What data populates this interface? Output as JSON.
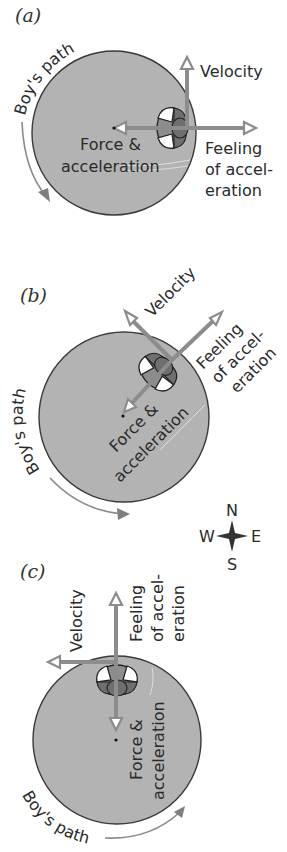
{
  "diagram": {
    "type": "physics-circular-motion",
    "panels": [
      {
        "id": "a",
        "label": "(a)",
        "path_label": "Boy's path",
        "velocity_label": "Velocity",
        "force_label_line1": "Force &",
        "force_label_line2": "acceleration",
        "feeling_label_line1": "Feeling",
        "feeling_label_line2": "of accel-",
        "feeling_label_line3": "eration",
        "boy_position": "east",
        "velocity_direction": "north",
        "force_direction": "west",
        "feeling_direction": "east"
      },
      {
        "id": "b",
        "label": "(b)",
        "path_label": "Boy's path",
        "velocity_label": "Velocity",
        "force_label_line1": "Force &",
        "force_label_line2": "acceleration",
        "feeling_label_line1": "Feeling",
        "feeling_label_line2": "of accel-",
        "feeling_label_line3": "eration",
        "boy_position": "northeast",
        "velocity_direction": "northwest",
        "force_direction": "southwest",
        "feeling_direction": "northeast"
      },
      {
        "id": "c",
        "label": "(c)",
        "path_label": "Boy's path",
        "velocity_label": "Velocity",
        "force_label_line1": "Force &",
        "force_label_line2": "acceleration",
        "feeling_label_line1": "Feeling",
        "feeling_label_line2": "of accel-",
        "feeling_label_line3": "eration",
        "boy_position": "north",
        "velocity_direction": "west",
        "force_direction": "south",
        "feeling_direction": "north"
      }
    ],
    "compass": {
      "north": "N",
      "south": "S",
      "east": "E",
      "west": "W"
    },
    "colors": {
      "disk_fill": "#b3b3b3",
      "disk_outline": "#3a3a3a",
      "arrow": "#8c8c8c",
      "arrow_head_fill": "#ffffff",
      "text": "#2a2a2a"
    }
  }
}
